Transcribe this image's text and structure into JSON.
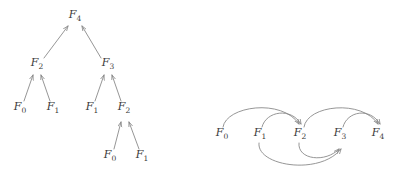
{
  "figure": {
    "background_color": "#ffffff",
    "label_color": "#3a3a3a",
    "edge_color": "#8a8a8a",
    "panels": [
      {
        "id": "recursion-tree",
        "caption": ""
      },
      {
        "id": "dependency-dag",
        "caption": ""
      }
    ]
  },
  "tree": {
    "title": "",
    "nodes": [
      {
        "id": "t-f4",
        "base": "F",
        "sub": "4",
        "x": 75,
        "y": 18
      },
      {
        "id": "t-f2",
        "base": "F",
        "sub": "2",
        "x": 37,
        "y": 66
      },
      {
        "id": "t-f3",
        "base": "F",
        "sub": "3",
        "x": 108,
        "y": 66
      },
      {
        "id": "t-f0-a",
        "base": "F",
        "sub": "0",
        "x": 20,
        "y": 110
      },
      {
        "id": "t-f1-a",
        "base": "F",
        "sub": "1",
        "x": 53,
        "y": 110
      },
      {
        "id": "t-f1-b",
        "base": "F",
        "sub": "1",
        "x": 92,
        "y": 110
      },
      {
        "id": "t-f2-b",
        "base": "F",
        "sub": "2",
        "x": 124,
        "y": 110
      },
      {
        "id": "t-f0-c",
        "base": "F",
        "sub": "0",
        "x": 110,
        "y": 158
      },
      {
        "id": "t-f1-c",
        "base": "F",
        "sub": "1",
        "x": 142,
        "y": 158
      }
    ],
    "edges": [
      {
        "from": "t-f2",
        "to": "t-f4",
        "direction": "child-to-parent"
      },
      {
        "from": "t-f3",
        "to": "t-f4",
        "direction": "child-to-parent"
      },
      {
        "from": "t-f0-a",
        "to": "t-f2",
        "direction": "child-to-parent"
      },
      {
        "from": "t-f1-a",
        "to": "t-f2",
        "direction": "child-to-parent"
      },
      {
        "from": "t-f1-b",
        "to": "t-f3",
        "direction": "child-to-parent"
      },
      {
        "from": "t-f2-b",
        "to": "t-f3",
        "direction": "child-to-parent"
      },
      {
        "from": "t-f0-c",
        "to": "t-f2-b",
        "direction": "child-to-parent"
      },
      {
        "from": "t-f1-c",
        "to": "t-f2-b",
        "direction": "child-to-parent"
      }
    ]
  },
  "dag": {
    "title": "",
    "nodes": [
      {
        "id": "d-f0",
        "base": "F",
        "sub": "0",
        "x": 222,
        "y": 136
      },
      {
        "id": "d-f1",
        "base": "F",
        "sub": "1",
        "x": 260,
        "y": 136
      },
      {
        "id": "d-f2",
        "base": "F",
        "sub": "2",
        "x": 300,
        "y": 136
      },
      {
        "id": "d-f3",
        "base": "F",
        "sub": "3",
        "x": 340,
        "y": 136
      },
      {
        "id": "d-f4",
        "base": "F",
        "sub": "4",
        "x": 378,
        "y": 136
      }
    ],
    "edges": [
      {
        "from": "d-f0",
        "to": "d-f2",
        "side": "above"
      },
      {
        "from": "d-f1",
        "to": "d-f2",
        "side": "above"
      },
      {
        "from": "d-f2",
        "to": "d-f4",
        "side": "above"
      },
      {
        "from": "d-f3",
        "to": "d-f4",
        "side": "above"
      },
      {
        "from": "d-f1",
        "to": "d-f3",
        "side": "below"
      },
      {
        "from": "d-f2",
        "to": "d-f3",
        "side": "below"
      }
    ]
  }
}
